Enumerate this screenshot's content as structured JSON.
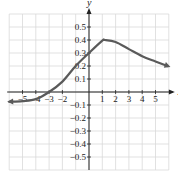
{
  "chart_data": {
    "type": "line",
    "title": "",
    "xlabel": "x",
    "ylabel": "y",
    "xlim": [
      -6,
      6
    ],
    "ylim": [
      -0.6,
      0.6
    ],
    "grid": true,
    "x_ticks": [
      "−5",
      "−4",
      "−3",
      "−2",
      "1",
      "2",
      "3",
      "4",
      "5"
    ],
    "y_ticks": [
      "0.5",
      "0.4",
      "0.3",
      "0.2",
      "0.1",
      "−0.1",
      "−0.2",
      "−0.3",
      "−0.4",
      "−0.5"
    ],
    "series": [
      {
        "name": "curve",
        "x": [
          -6,
          -5,
          -4,
          -3,
          -2,
          -1,
          0,
          1,
          1.2,
          2,
          3,
          4,
          5,
          5.9
        ],
        "y": [
          -0.075,
          -0.07,
          -0.055,
          0,
          0.08,
          0.2,
          0.3,
          0.395,
          0.4,
          0.385,
          0.33,
          0.275,
          0.235,
          0.2
        ],
        "arrows": "both"
      }
    ],
    "colors": {
      "curve": "#5a5a5a",
      "grid": "#d9d9d9",
      "axis": "#222222"
    }
  }
}
